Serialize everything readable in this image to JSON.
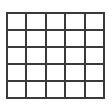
{
  "figure": {
    "kind": "grid",
    "rows": 5,
    "columns": 5,
    "colors": {
      "background": "#ffffff",
      "line": "#3a3a3a",
      "cell_fill": "#ffffff"
    },
    "line_width_px": 2,
    "cells": [
      [
        "",
        "",
        "",
        "",
        ""
      ],
      [
        "",
        "",
        "",
        "",
        ""
      ],
      [
        "",
        "",
        "",
        "",
        ""
      ],
      [
        "",
        "",
        "",
        "",
        ""
      ],
      [
        "",
        "",
        "",
        "",
        ""
      ]
    ]
  }
}
